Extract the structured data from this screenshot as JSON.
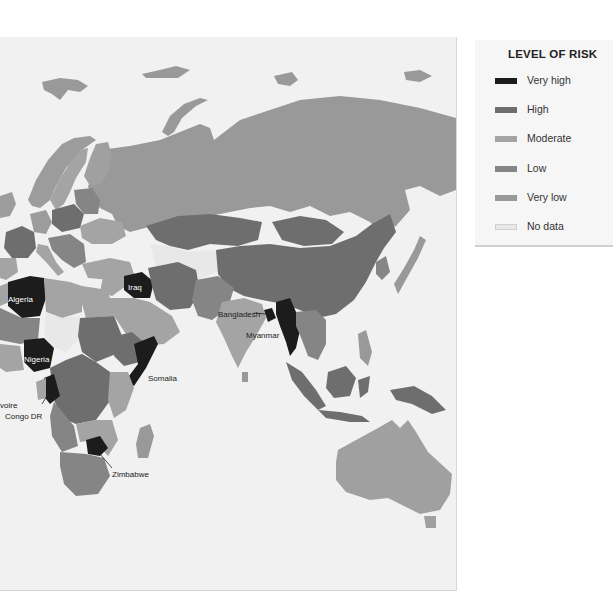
{
  "legend": {
    "title": "LEVEL OF RISK",
    "items": [
      {
        "label": "Very high",
        "color": "#1c1c1c"
      },
      {
        "label": "High",
        "color": "#6e6e6e"
      },
      {
        "label": "Moderate",
        "color": "#a4a4a4"
      },
      {
        "label": "Low",
        "color": "#858585"
      },
      {
        "label": "Very low",
        "color": "#999999"
      },
      {
        "label": "No data",
        "color": "#e8e8e8"
      }
    ]
  },
  "labels": {
    "algeria": "Algeria",
    "iraq": "Iraq",
    "nigeria": "Nigeria",
    "somalia": "Somalia",
    "cote_divoire": "voire",
    "congo_dr": "Congo DR",
    "zimbabwe": "Zimbabwe",
    "bangladesh": "Bangladesh",
    "myanmar": "Myanmar"
  },
  "colors": {
    "sea": "#f1f1f1",
    "very_high": "#1c1c1c",
    "high": "#6e6e6e",
    "moderate": "#a4a4a4",
    "low": "#858585",
    "very_low": "#999999",
    "no_data": "#e8e8e8"
  }
}
